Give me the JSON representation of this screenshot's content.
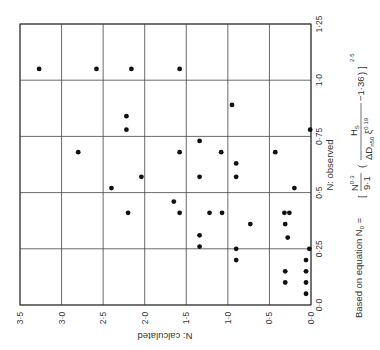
{
  "chart_data": {
    "type": "scatter",
    "orientation": "rotated-90-clockwise",
    "title": "",
    "xlabel": "N: observed",
    "ylabel": "N: calculated",
    "xlim": [
      0.0,
      1.25
    ],
    "ylim": [
      0.0,
      3.5
    ],
    "x_ticks": [
      "0·0",
      "0·25",
      "0·5",
      "0·75",
      "1·0",
      "1·25"
    ],
    "x_tick_values": [
      0.0,
      0.25,
      0.5,
      0.75,
      1.0,
      1.25
    ],
    "y_ticks": [
      "0·0",
      "0·5",
      "1·0",
      "1·5",
      "2·0",
      "2·5",
      "3·0",
      "3·5"
    ],
    "y_tick_values": [
      0.0,
      0.5,
      1.0,
      1.5,
      2.0,
      2.5,
      3.0,
      3.5
    ],
    "grid": true,
    "legend": null,
    "annotation": {
      "prefix": "Based on equation N",
      "sub0": "0",
      "equals": " = ",
      "num": "N",
      "num_exp": "0·3",
      "den": "9·1",
      "hs": "H",
      "hs_sub": "S",
      "delta": "ΔD",
      "dn_sub": "n50",
      "xi": "ξ",
      "xi_sub": "z",
      "xi_exp": "0·19",
      "minus": "−1·36",
      "outer_exp": "2·5"
    },
    "points": [
      {
        "observed": 1.05,
        "calculated": 3.27
      },
      {
        "observed": 1.05,
        "calculated": 2.58
      },
      {
        "observed": 1.05,
        "calculated": 2.16
      },
      {
        "observed": 1.05,
        "calculated": 1.58
      },
      {
        "observed": 0.89,
        "calculated": 0.95
      },
      {
        "observed": 0.84,
        "calculated": 2.22
      },
      {
        "observed": 0.78,
        "calculated": 2.22
      },
      {
        "observed": 0.78,
        "calculated": 0.01
      },
      {
        "observed": 0.68,
        "calculated": 2.8
      },
      {
        "observed": 0.73,
        "calculated": 1.34
      },
      {
        "observed": 0.68,
        "calculated": 1.58
      },
      {
        "observed": 0.68,
        "calculated": 1.08
      },
      {
        "observed": 0.68,
        "calculated": 0.43
      },
      {
        "observed": 0.63,
        "calculated": 0.9
      },
      {
        "observed": 0.57,
        "calculated": 0.9
      },
      {
        "observed": 0.57,
        "calculated": 1.34
      },
      {
        "observed": 0.57,
        "calculated": 2.04
      },
      {
        "observed": 0.52,
        "calculated": 0.2
      },
      {
        "observed": 0.52,
        "calculated": 2.4
      },
      {
        "observed": 0.46,
        "calculated": 1.65
      },
      {
        "observed": 0.41,
        "calculated": 1.58
      },
      {
        "observed": 0.41,
        "calculated": 2.2
      },
      {
        "observed": 0.41,
        "calculated": 1.22
      },
      {
        "observed": 0.41,
        "calculated": 1.07
      },
      {
        "observed": 0.41,
        "calculated": 0.32
      },
      {
        "observed": 0.41,
        "calculated": 0.26
      },
      {
        "observed": 0.36,
        "calculated": 0.73
      },
      {
        "observed": 0.36,
        "calculated": 0.31
      },
      {
        "observed": 0.3,
        "calculated": 0.28
      },
      {
        "observed": 0.31,
        "calculated": 1.34
      },
      {
        "observed": 0.26,
        "calculated": 1.34
      },
      {
        "observed": 0.25,
        "calculated": 0.9
      },
      {
        "observed": 0.25,
        "calculated": 0.02
      },
      {
        "observed": 0.2,
        "calculated": 0.9
      },
      {
        "observed": 0.2,
        "calculated": 0.06
      },
      {
        "observed": 0.15,
        "calculated": 0.31
      },
      {
        "observed": 0.15,
        "calculated": 0.06
      },
      {
        "observed": 0.1,
        "calculated": 0.31
      },
      {
        "observed": 0.1,
        "calculated": 0.06
      },
      {
        "observed": 0.05,
        "calculated": 0.06
      }
    ]
  }
}
